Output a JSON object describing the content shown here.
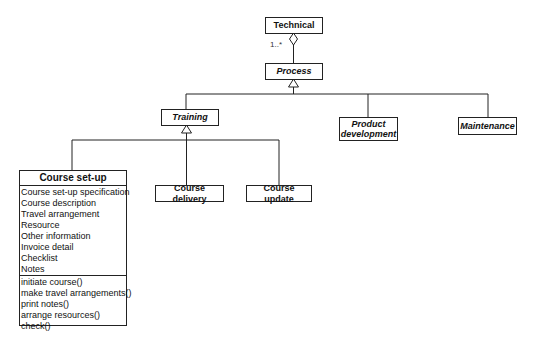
{
  "diagram": {
    "type": "uml-class",
    "classes": {
      "technical": {
        "name": "Technical",
        "abstract": false
      },
      "process": {
        "name": "Process",
        "abstract": true
      },
      "training": {
        "name": "Training",
        "abstract": true
      },
      "product_development": {
        "name": "Product development",
        "abstract": true
      },
      "maintenance": {
        "name": "Maintenance",
        "abstract": true
      },
      "course_delivery": {
        "name": "Course delivery",
        "abstract": false
      },
      "course_update": {
        "name": "Course update",
        "abstract": false
      },
      "course_setup": {
        "name": "Course set-up",
        "abstract": false,
        "attributes": [
          "Course set-up specification",
          "Course description",
          "Travel arrangement",
          "Resource",
          "Other information",
          "Invoice detail",
          "Checklist",
          "Notes"
        ],
        "operations": [
          "initiate course()",
          "make travel arrangements()",
          "print notes()",
          "arrange resources()",
          "check()"
        ]
      }
    },
    "relationships": [
      {
        "type": "aggregation",
        "whole": "Technical",
        "part": "Process",
        "multiplicity": "1..*"
      },
      {
        "type": "generalization",
        "parent": "Process",
        "children": [
          "Training",
          "Product development",
          "Maintenance"
        ]
      },
      {
        "type": "generalization",
        "parent": "Training",
        "children": [
          "Course set-up",
          "Course delivery",
          "Course update"
        ]
      }
    ],
    "multiplicity_label": "1..*"
  }
}
